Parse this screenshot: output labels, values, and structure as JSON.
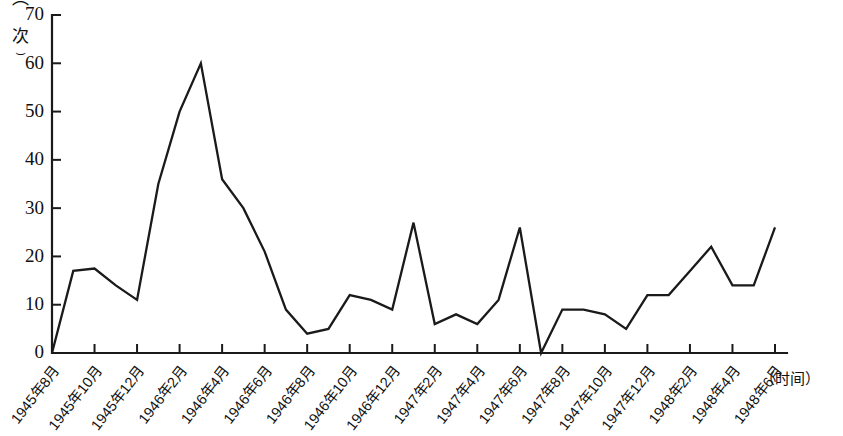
{
  "chart_data": {
    "type": "line",
    "title": "",
    "xlabel": "（时间）",
    "ylabel": "（次）",
    "ylim": [
      0,
      70
    ],
    "yticks": [
      0,
      10,
      20,
      30,
      40,
      50,
      60,
      70
    ],
    "grid": false,
    "legend": null,
    "x_tick_labels": [
      "1945年8月",
      "1945年10月",
      "1945年12月",
      "1946年2月",
      "1946年4月",
      "1946年6月",
      "1946年8月",
      "1946年10月",
      "1946年12月",
      "1947年2月",
      "1947年4月",
      "1947年6月",
      "1947年8月",
      "1947年10月",
      "1947年12月",
      "1948年2月",
      "1948年4月",
      "1948年6月"
    ],
    "x": [
      "1945年8月",
      "1945年9月",
      "1945年10月",
      "1945年11月",
      "1945年12月",
      "1946年1月",
      "1946年2月",
      "1946年3月",
      "1946年4月",
      "1946年5月",
      "1946年6月",
      "1946年7月",
      "1946年8月",
      "1946年9月",
      "1946年10月",
      "1946年11月",
      "1946年12月",
      "1947年1月",
      "1947年2月",
      "1947年3月",
      "1947年4月",
      "1947年5月",
      "1947年6月",
      "1947年7月",
      "1947年8月",
      "1947年9月",
      "1947年10月",
      "1947年11月",
      "1947年12月",
      "1948年1月",
      "1948年2月",
      "1948年3月",
      "1948年4月",
      "1948年5月",
      "1948年6月"
    ],
    "values": [
      0,
      17,
      17.5,
      14,
      11,
      35,
      50,
      60,
      36,
      30,
      21,
      9,
      4,
      5,
      12,
      11,
      9,
      27,
      6,
      8,
      6,
      11,
      26,
      0,
      9,
      9,
      8,
      5,
      12,
      12,
      17,
      22,
      14,
      14,
      26
    ]
  }
}
